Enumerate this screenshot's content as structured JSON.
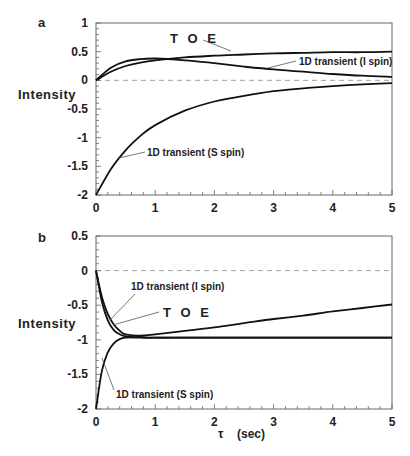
{
  "chart_data": [
    {
      "panel": "a",
      "type": "line",
      "title": "",
      "xlabel": "τ (sec)",
      "ylabel": "Intensity",
      "xlim": [
        0,
        5
      ],
      "ylim": [
        -2,
        1
      ],
      "xticks": [
        0,
        1,
        2,
        3,
        4,
        5
      ],
      "yticks": [
        1,
        0.5,
        0,
        -0.5,
        -1,
        -1.5,
        -2
      ],
      "ytick_labels": [
        "1",
        "0.5",
        "0",
        "-0.5",
        "-1",
        "-1.5",
        "-2"
      ],
      "grid": false,
      "reference_line": {
        "y": 0,
        "style": "dashed"
      },
      "x": [
        0,
        0.25,
        0.5,
        0.75,
        1,
        1.5,
        2,
        2.5,
        3,
        3.5,
        4,
        4.5,
        5
      ],
      "series": [
        {
          "name": "TOE",
          "values": [
            0,
            0.15,
            0.25,
            0.31,
            0.35,
            0.4,
            0.43,
            0.45,
            0.47,
            0.48,
            0.49,
            0.49,
            0.5
          ]
        },
        {
          "name": "1D transient (I spin)",
          "values": [
            0,
            0.22,
            0.33,
            0.37,
            0.38,
            0.35,
            0.3,
            0.24,
            0.19,
            0.15,
            0.11,
            0.08,
            0.06
          ]
        },
        {
          "name": "1D transient (S spin)",
          "values": [
            -2,
            -1.55,
            -1.22,
            -0.97,
            -0.78,
            -0.53,
            -0.37,
            -0.27,
            -0.19,
            -0.14,
            -0.1,
            -0.07,
            -0.05
          ]
        }
      ],
      "annotations": [
        "TOE",
        "1D transient (I spin)",
        "1D transient (S spin)"
      ]
    },
    {
      "panel": "b",
      "type": "line",
      "title": "",
      "xlabel": "τ (sec)",
      "ylabel": "Intensity",
      "xlim": [
        0,
        5
      ],
      "ylim": [
        -2,
        0.5
      ],
      "xticks": [
        0,
        1,
        2,
        3,
        4,
        5
      ],
      "yticks": [
        0.5,
        0,
        -0.5,
        -1,
        -1.5,
        -2
      ],
      "ytick_labels": [
        "0.5",
        "0",
        "-0.5",
        "-1",
        "-1.5",
        "-2"
      ],
      "grid": false,
      "reference_line": {
        "y": 0,
        "style": "dashed"
      },
      "x": [
        0,
        0.1,
        0.2,
        0.3,
        0.4,
        0.5,
        0.75,
        1,
        1.5,
        2,
        2.5,
        3,
        3.5,
        4,
        4.5,
        5
      ],
      "series": [
        {
          "name": "1D transient (I spin)",
          "values": [
            0,
            -0.45,
            -0.72,
            -0.86,
            -0.92,
            -0.95,
            -0.97,
            -0.97,
            -0.97,
            -0.97,
            -0.97,
            -0.97,
            -0.97,
            -0.97,
            -0.97,
            -0.97
          ]
        },
        {
          "name": "TOE",
          "values": [
            0,
            -0.38,
            -0.63,
            -0.78,
            -0.87,
            -0.92,
            -0.94,
            -0.92,
            -0.87,
            -0.82,
            -0.76,
            -0.7,
            -0.65,
            -0.59,
            -0.54,
            -0.49
          ]
        },
        {
          "name": "1D transient (S spin)",
          "values": [
            -2,
            -1.45,
            -1.18,
            -1.05,
            -0.99,
            -0.97,
            -0.96,
            -0.97,
            -0.97,
            -0.97,
            -0.97,
            -0.97,
            -0.97,
            -0.97,
            -0.97,
            -0.97
          ]
        }
      ],
      "annotations": [
        "1D transient (I spin)",
        "TOE",
        "1D transient (S spin)"
      ]
    }
  ],
  "labels": {
    "panel_a": "a",
    "panel_b": "b",
    "ylabel": "Intensity",
    "xlabel_symbol": "τ",
    "xlabel_unit": "(sec)",
    "toe": "T O E",
    "i_spin": "1D transient (I spin)",
    "s_spin": "1D transient (S spin)"
  },
  "colors": {
    "curve": "#111111",
    "axis": "#666666",
    "dashed": "#888888",
    "text": "#222222"
  }
}
